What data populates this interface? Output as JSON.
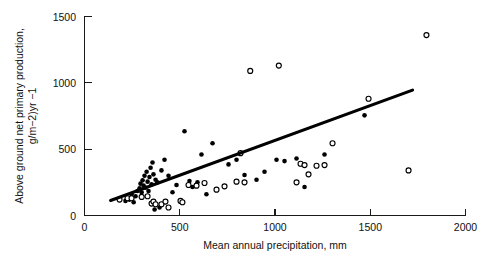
{
  "figure": {
    "background_color": "#ffffff",
    "foreground_color": "#000000"
  },
  "axes": {
    "y_title_line1": "Above ground net primary production,",
    "y_title_line2": "g/m−2)yr −1",
    "x_title": "Mean annual precipitation, mm",
    "x_ticklabels": [
      "0",
      "500",
      "1000",
      "1500",
      "2000"
    ],
    "y_ticklabels": [
      "0",
      "500",
      "1000",
      "1500"
    ]
  },
  "chart_data": {
    "type": "scatter",
    "title": "",
    "xlabel": "Mean annual precipitation, mm",
    "ylabel": "Above ground net primary production, g/m−2)yr −1",
    "xlim": [
      0,
      2000
    ],
    "ylim": [
      0,
      1500
    ],
    "xticks": [
      0,
      500,
      1000,
      1500,
      2000
    ],
    "yticks": [
      0,
      500,
      1000,
      1500
    ],
    "grid": false,
    "legend": false,
    "series": [
      {
        "name": "filled-circles",
        "marker": "filled-circle",
        "color": "#000000",
        "points": [
          [
            215,
            110
          ],
          [
            236,
            120
          ],
          [
            247,
            160
          ],
          [
            258,
            100
          ],
          [
            268,
            145
          ],
          [
            278,
            185
          ],
          [
            289,
            205
          ],
          [
            294,
            240
          ],
          [
            300,
            175
          ],
          [
            305,
            265
          ],
          [
            310,
            225
          ],
          [
            315,
            300
          ],
          [
            320,
            210
          ],
          [
            326,
            330
          ],
          [
            331,
            255
          ],
          [
            336,
            185
          ],
          [
            341,
            290
          ],
          [
            347,
            360
          ],
          [
            352,
            235
          ],
          [
            357,
            400
          ],
          [
            362,
            310
          ],
          [
            368,
            45
          ],
          [
            373,
            270
          ],
          [
            383,
            250
          ],
          [
            394,
            60
          ],
          [
            404,
            340
          ],
          [
            420,
            420
          ],
          [
            441,
            300
          ],
          [
            462,
            175
          ],
          [
            483,
            230
          ],
          [
            525,
            635
          ],
          [
            551,
            260
          ],
          [
            567,
            215
          ],
          [
            593,
            250
          ],
          [
            614,
            460
          ],
          [
            640,
            160
          ],
          [
            672,
            545
          ],
          [
            756,
            385
          ],
          [
            798,
            420
          ],
          [
            840,
            305
          ],
          [
            903,
            270
          ],
          [
            945,
            330
          ],
          [
            1008,
            420
          ],
          [
            1050,
            410
          ],
          [
            1113,
            430
          ],
          [
            1155,
            215
          ],
          [
            1260,
            460
          ],
          [
            1470,
            755
          ]
        ]
      },
      {
        "name": "open-circles",
        "marker": "open-circle",
        "color": "#000000",
        "points": [
          [
            184,
            120
          ],
          [
            226,
            130
          ],
          [
            247,
            130
          ],
          [
            300,
            140
          ],
          [
            331,
            145
          ],
          [
            352,
            90
          ],
          [
            362,
            105
          ],
          [
            373,
            85
          ],
          [
            404,
            85
          ],
          [
            425,
            105
          ],
          [
            441,
            60
          ],
          [
            504,
            110
          ],
          [
            514,
            100
          ],
          [
            546,
            230
          ],
          [
            588,
            225
          ],
          [
            630,
            245
          ],
          [
            693,
            195
          ],
          [
            735,
            220
          ],
          [
            798,
            255
          ],
          [
            819,
            470
          ],
          [
            840,
            250
          ],
          [
            870,
            1090
          ],
          [
            1020,
            1130
          ],
          [
            1113,
            250
          ],
          [
            1134,
            390
          ],
          [
            1155,
            380
          ],
          [
            1176,
            310
          ],
          [
            1218,
            375
          ],
          [
            1260,
            380
          ],
          [
            1302,
            545
          ],
          [
            1491,
            880
          ],
          [
            1701,
            340
          ],
          [
            1795,
            1360
          ]
        ]
      }
    ],
    "trendline": {
      "type": "line",
      "x": [
        137,
        1722
      ],
      "y": [
        113,
        945
      ],
      "color": "#000000"
    }
  }
}
